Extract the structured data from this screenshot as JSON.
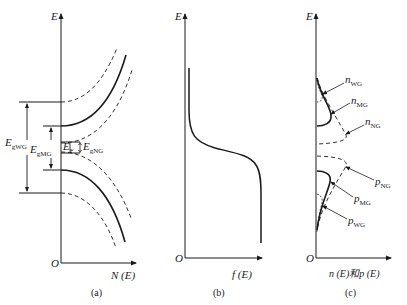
{
  "figure": {
    "panels": [
      {
        "id": "a",
        "caption": "(a)",
        "y_axis_label": "E",
        "x_axis_label": "N (E)",
        "origin_label": "O",
        "annotations": {
          "egwg": {
            "main": "E",
            "sub": "gWG"
          },
          "egmg": {
            "main": "E",
            "sub": "gMG"
          },
          "ef": {
            "main": "E",
            "sub": "F"
          },
          "egng": {
            "main": "E",
            "sub": "gNG"
          }
        },
        "curves": [
          "conduction band (MG, solid)",
          "conduction band (WG, dashed)",
          "conduction band (NG, dashed)",
          "valence band (MG, solid)",
          "valence band (WG, dashed)",
          "valence band (NG, dashed)"
        ]
      },
      {
        "id": "b",
        "caption": "(b)",
        "y_axis_label": "E",
        "x_axis_label": "f (E)",
        "origin_label": "O",
        "curves": [
          "Fermi-Dirac distribution f(E)"
        ]
      },
      {
        "id": "c",
        "caption": "(c)",
        "y_axis_label": "E",
        "x_axis_label": "n (E)和p (E)",
        "origin_label": "O",
        "annotations": {
          "nwg": {
            "main": "n",
            "sub": "WG"
          },
          "nmg": {
            "main": "n",
            "sub": "MG"
          },
          "nng": {
            "main": "n",
            "sub": "NG"
          },
          "png": {
            "main": "p",
            "sub": "NG"
          },
          "pmg": {
            "main": "p",
            "sub": "MG"
          },
          "pwg": {
            "main": "p",
            "sub": "WG"
          }
        }
      }
    ],
    "colors": {
      "line": "#1a1a1a",
      "background": "#ffffff"
    }
  }
}
